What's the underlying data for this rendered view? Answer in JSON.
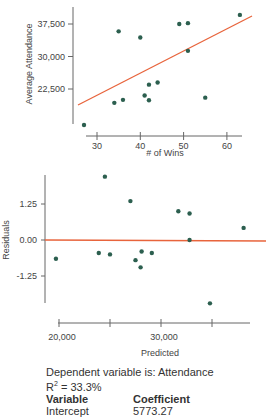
{
  "colors": {
    "point": "#2c5f4f",
    "line": "#e8643c",
    "axis": "#666666"
  },
  "chart_data": [
    {
      "type": "scatter",
      "title": "",
      "xlabel": "# of Wins",
      "ylabel": "Average Attendance",
      "xticks": [
        "30",
        "40",
        "50",
        "60"
      ],
      "yticks": [
        "22,500",
        "30,000",
        "37,500"
      ],
      "xlim": [
        26,
        64
      ],
      "ylim": [
        13500,
        42000
      ],
      "points": [
        {
          "x": 27,
          "y": 14200
        },
        {
          "x": 34,
          "y": 19300
        },
        {
          "x": 35,
          "y": 35800
        },
        {
          "x": 36,
          "y": 20000
        },
        {
          "x": 40,
          "y": 34400
        },
        {
          "x": 41,
          "y": 21000
        },
        {
          "x": 42,
          "y": 23500
        },
        {
          "x": 42,
          "y": 19900
        },
        {
          "x": 44,
          "y": 24000
        },
        {
          "x": 49,
          "y": 37500
        },
        {
          "x": 51,
          "y": 37700
        },
        {
          "x": 51,
          "y": 31300
        },
        {
          "x": 55,
          "y": 20500
        },
        {
          "x": 63,
          "y": 39600
        }
      ],
      "regression_line": {
        "x1": 26,
        "y1": 18800,
        "x2": 64,
        "y2": 38600
      }
    },
    {
      "type": "scatter",
      "title": "",
      "xlabel": "Predicted",
      "ylabel": "Residuals",
      "xticks": [
        "20,000",
        "",
        "30,000",
        ""
      ],
      "yticks": [
        "1.25",
        "0.00",
        "-1.25"
      ],
      "xlim": [
        18500,
        38000
      ],
      "ylim": [
        -2.4,
        2.6
      ],
      "points": [
        {
          "x": 19700,
          "y": -0.65
        },
        {
          "x": 23900,
          "y": -0.45
        },
        {
          "x": 24500,
          "y": 2.2
        },
        {
          "x": 25000,
          "y": -0.5
        },
        {
          "x": 27000,
          "y": 1.35
        },
        {
          "x": 27500,
          "y": -0.7
        },
        {
          "x": 28000,
          "y": -0.95
        },
        {
          "x": 28100,
          "y": -0.4
        },
        {
          "x": 29100,
          "y": -0.45
        },
        {
          "x": 31700,
          "y": 1.0
        },
        {
          "x": 32800,
          "y": 0.92
        },
        {
          "x": 32800,
          "y": 0.0
        },
        {
          "x": 34800,
          "y": -2.2
        },
        {
          "x": 38100,
          "y": 0.42
        }
      ],
      "zero_line": 0
    }
  ],
  "summary": {
    "dependent": "Dependent variable is: Attendance",
    "r2_label": "R",
    "r2_sup": "2",
    "r2_value": " = 33.3%",
    "header_variable": "Variable",
    "header_coefficient": "Coefficient",
    "rows": [
      {
        "variable": "Intercept",
        "coefficient": "5773.27"
      }
    ]
  }
}
